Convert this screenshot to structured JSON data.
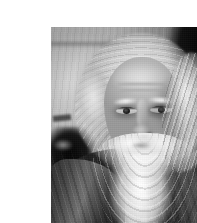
{
  "page": {
    "background_color": "#ffffff",
    "width": 197,
    "height": 223
  },
  "photo": {
    "kind": "photograph",
    "medium": "black-and-white photograph",
    "orientation": "portrait",
    "frame": {
      "left": 11,
      "top": 11,
      "width": 176,
      "height": 200
    },
    "alt_text": "Black-and-white portrait photograph of an elderly bearded man with long white hair and a full flowing white beard, looking slightly to his right, against a mottled wall with dark foliage on the right.",
    "caption": "",
    "subject": {
      "description": "Elderly man, head and shoulders",
      "hair": "Long white hair swept back from a high forehead",
      "beard": "Full, long, flowing white beard and moustache",
      "expression": "Serious, contemplative, gazing slightly off to his right",
      "clothing": "Dark draped robe over the shoulders"
    },
    "background": {
      "left": "Light grey mottled wall with faint horizontal ledge",
      "right": "Dark shadowed foliage",
      "lower_left": "Dark shadow patch"
    },
    "tones": {
      "highlight": "#faf9f6",
      "light_grey": "#cfccc5",
      "mid_grey": "#8e8b85",
      "shadow": "#3a3937",
      "black": "#0b0b0a"
    }
  }
}
